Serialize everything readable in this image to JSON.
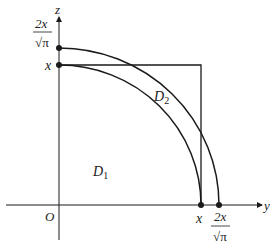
{
  "diagram": {
    "type": "integration-region-comparison",
    "axes": {
      "horizontal_label": "y",
      "vertical_label": "z",
      "origin_label": "O"
    },
    "regions": [
      {
        "label": "D",
        "subscript": "1"
      },
      {
        "label": "D",
        "subscript": "2"
      }
    ],
    "tick_labels": {
      "y_axis_inner": "x",
      "y_axis_outer_num": "2x",
      "y_axis_outer_den": "√π",
      "z_axis_inner": "x",
      "z_axis_outer_num": "2x",
      "z_axis_outer_den": "√π"
    },
    "shapes": [
      {
        "kind": "quarter-circle",
        "radius": "x"
      },
      {
        "kind": "quarter-circle",
        "radius": "2x/√π"
      },
      {
        "kind": "square",
        "side": "x"
      }
    ],
    "colors": {
      "stroke": "#1a1a1a",
      "background": "#ffffff"
    }
  }
}
